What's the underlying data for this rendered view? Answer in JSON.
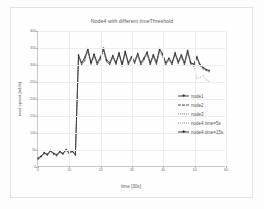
{
  "figure": {
    "title": "Node4 with different timeThreshold",
    "background_color": "#fdfdfd",
    "grid_color": "#ededed",
    "axis_color": "#c9c9c9",
    "text_color": "#5d5d5d"
  },
  "axes": {
    "ylabel": "read speed [mb/s]",
    "xlabel": "time [30s]",
    "yticks": [
      "0",
      "50",
      "100",
      "150",
      "200",
      "250",
      "300",
      "350",
      "400"
    ],
    "xticks": [
      "0",
      "10",
      "20",
      "30",
      "40",
      "50",
      "60"
    ]
  },
  "legend": {
    "position": "center-right",
    "items": [
      {
        "label": "node1",
        "marker": "cross",
        "line": "solid",
        "color": "#2f2f2f"
      },
      {
        "label": "node2",
        "marker": "dash",
        "line": "dashed",
        "color": "#3a3a3a"
      },
      {
        "label": "node3",
        "marker": "dot",
        "line": "dotted",
        "color": "#4a4a4a"
      },
      {
        "label": "node4 time=5s",
        "marker": "dot",
        "line": "dotted",
        "color": "#5a5a5a"
      },
      {
        "label": "node4 time=15s",
        "marker": "cross",
        "line": "solid",
        "color": "#1f1f1f"
      }
    ]
  },
  "chart_data": {
    "type": "line",
    "title": "Node4 with different timeThreshold",
    "xlabel": "time [30s]",
    "ylabel": "read speed [mb/s]",
    "xlim": [
      0,
      60
    ],
    "ylim": [
      0,
      400
    ],
    "grid": true,
    "legend_position": "center-right",
    "x": [
      0,
      1,
      2,
      3,
      4,
      5,
      6,
      7,
      8,
      9,
      10,
      11,
      12,
      13,
      14,
      15,
      16,
      17,
      18,
      19,
      20,
      21,
      22,
      23,
      24,
      25,
      26,
      27,
      28,
      29,
      30,
      31,
      32,
      33,
      34,
      35,
      36,
      37,
      38,
      39,
      40,
      41,
      42,
      43,
      44,
      45,
      46,
      47,
      48,
      49,
      50,
      51,
      52,
      53,
      54,
      55
    ],
    "series": [
      {
        "name": "node1",
        "values": [
          20,
          28,
          40,
          32,
          45,
          35,
          30,
          42,
          36,
          48,
          38,
          44,
          33,
          330,
          300,
          312,
          345,
          305,
          330,
          300,
          316,
          347,
          312,
          300,
          325,
          302,
          333,
          297,
          338,
          300,
          322,
          305,
          330,
          300,
          318,
          336,
          300,
          328,
          302,
          345,
          330,
          300,
          318,
          300,
          333,
          305,
          327,
          300,
          340,
          305,
          300,
          325,
          300,
          290,
          285,
          282
        ]
      },
      {
        "name": "node2",
        "values": [
          22,
          26,
          38,
          34,
          42,
          37,
          31,
          40,
          38,
          46,
          36,
          43,
          34,
          318,
          305,
          320,
          340,
          300,
          326,
          303,
          320,
          340,
          308,
          303,
          320,
          305,
          330,
          300,
          334,
          303,
          318,
          308,
          326,
          302,
          315,
          332,
          303,
          325,
          305,
          340,
          326,
          303,
          315,
          303,
          330,
          308,
          323,
          303,
          336,
          303,
          298,
          320,
          297,
          288,
          283,
          280
        ]
      },
      {
        "name": "node3",
        "values": [
          24,
          30,
          36,
          33,
          44,
          36,
          33,
          39,
          35,
          45,
          39,
          41,
          32,
          322,
          300,
          316,
          338,
          303,
          322,
          300,
          318,
          342,
          310,
          300,
          322,
          300,
          328,
          298,
          332,
          300,
          320,
          303,
          328,
          300,
          316,
          330,
          300,
          322,
          300,
          338,
          322,
          300,
          316,
          300,
          328,
          303,
          320,
          300,
          334,
          300,
          295,
          318,
          295,
          286,
          282,
          278
        ]
      },
      {
        "name": "node4 time=5s",
        "values": [
          21,
          27,
          37,
          31,
          43,
          34,
          32,
          41,
          34,
          47,
          37,
          42,
          31,
          325,
          302,
          318,
          342,
          300,
          328,
          302,
          318,
          344,
          308,
          302,
          318,
          303,
          331,
          296,
          336,
          302,
          316,
          306,
          329,
          300,
          312,
          334,
          302,
          326,
          303,
          342,
          328,
          302,
          312,
          302,
          331,
          306,
          325,
          302,
          338,
          302,
          296,
          260,
          262,
          268,
          255,
          250
        ]
      },
      {
        "name": "node4 time=15s",
        "values": [
          23,
          29,
          39,
          35,
          46,
          38,
          34,
          43,
          37,
          49,
          40,
          45,
          35,
          328,
          306,
          322,
          348,
          306,
          332,
          306,
          322,
          350,
          314,
          306,
          328,
          306,
          336,
          302,
          340,
          306,
          324,
          310,
          334,
          306,
          320,
          338,
          306,
          330,
          308,
          348,
          332,
          306,
          320,
          306,
          336,
          310,
          330,
          306,
          343,
          306,
          302,
          322,
          300,
          292,
          286,
          283
        ]
      }
    ]
  }
}
